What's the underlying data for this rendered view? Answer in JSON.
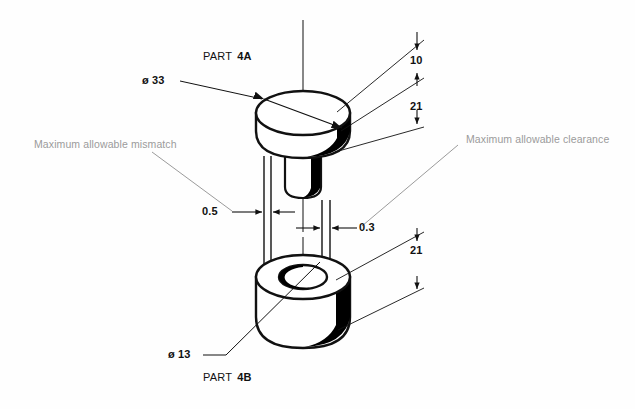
{
  "drawing": {
    "title_parts": {
      "top": {
        "prefix": "PART",
        "number": "4A"
      },
      "bottom": {
        "prefix": "PART",
        "number": "4B"
      }
    },
    "diameters": {
      "outer": {
        "symbol": "ø",
        "value": "33"
      },
      "bore": {
        "symbol": "ø",
        "value": "13"
      }
    },
    "dimensions": {
      "top_flange_height": "10",
      "top_body_height": "21",
      "bottom_body_height": "21",
      "mismatch_gap": "0.5",
      "clearance_gap": "0.3"
    },
    "notes": {
      "left": "Maximum allowable mismatch",
      "right": "Maximum allowable clearance"
    },
    "colors": {
      "line": "#111111",
      "note_text": "#9b9b9b",
      "shade": "#000000",
      "background": "#fefefe"
    }
  }
}
